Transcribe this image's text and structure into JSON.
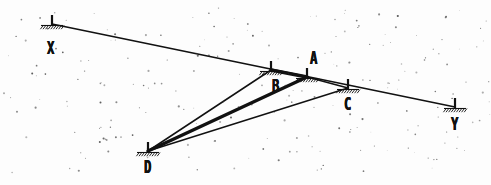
{
  "document": {
    "kind": "scanned-survey-diagram",
    "background_color": "#fdfdfd",
    "ink_color": "#111111"
  },
  "chart_data": {
    "type": "scatter",
    "title": "",
    "xlabel": "",
    "ylabel": "",
    "xlim": [
      0,
      491
    ],
    "ylim": [
      185,
      0
    ],
    "grid": false,
    "legend": null,
    "annotations": [
      "baseline X-Y passes through stations B, A and C",
      "observation station D sights to B, A and C",
      "ray D-A drawn with heavy weight"
    ],
    "points": [
      {
        "label": "X",
        "x": 52,
        "y": 24,
        "label_dx": -5,
        "label_dy": 16,
        "marker": "survey-station"
      },
      {
        "label": "B",
        "x": 271,
        "y": 70,
        "label_dx": 1,
        "label_dy": 8,
        "marker": "survey-station"
      },
      {
        "label": "A",
        "x": 307,
        "y": 77,
        "label_dx": 3,
        "label_dy": -27,
        "marker": "survey-station"
      },
      {
        "label": "C",
        "x": 348,
        "y": 88,
        "label_dx": -4,
        "label_dy": 8,
        "marker": "survey-station"
      },
      {
        "label": "Y",
        "x": 455,
        "y": 107,
        "label_dx": -4,
        "label_dy": 9,
        "marker": "survey-station"
      },
      {
        "label": "D",
        "x": 148,
        "y": 151,
        "label_dx": -4,
        "label_dy": 8,
        "marker": "survey-station"
      }
    ],
    "segments": [
      {
        "name": "baseline-XY",
        "from": "X",
        "to": "Y",
        "width": 1.6,
        "style": "solid"
      },
      {
        "name": "ray-D-to-B",
        "from": "D",
        "to": "B",
        "width": 1.5,
        "style": "solid"
      },
      {
        "name": "ray-D-to-A",
        "from": "D",
        "to": "A",
        "width": 3.4,
        "style": "solid"
      },
      {
        "name": "ray-D-to-C",
        "from": "D",
        "to": "C",
        "width": 1.5,
        "style": "solid"
      },
      {
        "name": "chord-B-to-A",
        "from": "B",
        "to": "A",
        "width": 3.4,
        "style": "solid"
      },
      {
        "name": "chord-A-to-C",
        "from": "A",
        "to": "C",
        "width": 1.5,
        "style": "solid"
      }
    ]
  },
  "labels": {
    "X": "X",
    "Y": "Y",
    "A": "A",
    "B": "B",
    "C": "C",
    "D": "D"
  }
}
